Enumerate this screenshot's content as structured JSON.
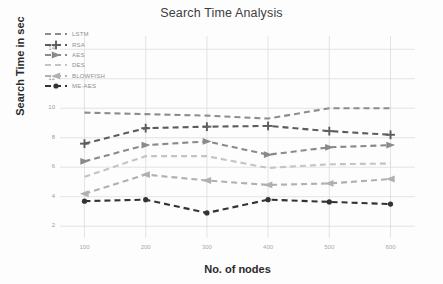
{
  "chart_data": {
    "type": "line",
    "title": "Search Time Analysis",
    "xlabel": "No. of nodes",
    "ylabel": "Search Time in sec",
    "categories": [
      "100",
      "200",
      "300",
      "400",
      "500",
      "600"
    ],
    "x": [
      100,
      200,
      300,
      400,
      500,
      600
    ],
    "xlim": [
      60,
      640
    ],
    "ylim": [
      1.2,
      14.9
    ],
    "yticks": [
      "14",
      "12",
      "10",
      "8",
      "6",
      "4",
      "2"
    ],
    "ytick_values": [
      14,
      12,
      10,
      8,
      6,
      4,
      2
    ],
    "grid": true,
    "legend_position": "upper left",
    "series": [
      {
        "name": "LSTM",
        "values": [
          9.7,
          9.6,
          9.5,
          9.3,
          10.0,
          10.0
        ],
        "color": "#8d8d8d",
        "marker": "none",
        "linestyle": "dashed"
      },
      {
        "name": "RSA",
        "values": [
          7.6,
          8.65,
          8.75,
          8.8,
          8.45,
          8.2
        ],
        "color": "#5d5d5d",
        "marker": "plus",
        "linestyle": "dashed"
      },
      {
        "name": "AES",
        "values": [
          6.4,
          7.5,
          7.75,
          6.85,
          7.35,
          7.5
        ],
        "color": "#8a8a8a",
        "marker": "triangle-right",
        "linestyle": "dashed"
      },
      {
        "name": "DES",
        "values": [
          5.35,
          6.75,
          6.75,
          5.95,
          6.2,
          6.25
        ],
        "color": "#c4c4c4",
        "marker": "none",
        "linestyle": "dashed"
      },
      {
        "name": "BLOWFISH",
        "values": [
          4.2,
          5.5,
          5.1,
          4.8,
          4.9,
          5.2
        ],
        "color": "#b0b0b0",
        "marker": "triangle-left",
        "linestyle": "dashed"
      },
      {
        "name": "ME-AES",
        "values": [
          3.7,
          3.8,
          2.9,
          3.8,
          3.65,
          3.5
        ],
        "color": "#333333",
        "marker": "circle",
        "linestyle": "dashed"
      }
    ]
  },
  "legend": {
    "items": [
      {
        "label": "LSTM"
      },
      {
        "label": "RSA"
      },
      {
        "label": "AES"
      },
      {
        "label": "DES"
      },
      {
        "label": "BLOWFISH"
      },
      {
        "label": "ME-AES"
      }
    ]
  },
  "axes": {
    "grid_color": "#d8d8d8",
    "background": "#fdfdfd"
  }
}
